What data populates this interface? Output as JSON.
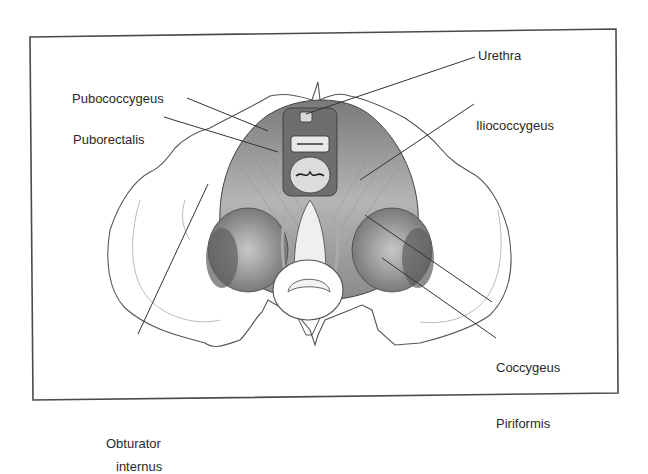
{
  "figure": {
    "type": "anatomical-illustration",
    "colors": {
      "border": "#4a4a4a",
      "line": "#333333",
      "muscle_dark": "#6b6b6b",
      "muscle_mid": "#a8a8a8",
      "muscle_light": "#d6d6d6",
      "bone": "#ffffff",
      "bone_outline": "#555555"
    }
  },
  "labels": {
    "urethra": "Urethra",
    "pubococcygeus": "Pubococcygeus",
    "puborectalis": "Puborectalis",
    "iliococcygeus": "Iliococcygeus",
    "coccygeus": "Coccygeus",
    "piriformis": "Piriformis",
    "obturator_internus_line1": "Obturator",
    "obturator_internus_line2": "internus"
  }
}
